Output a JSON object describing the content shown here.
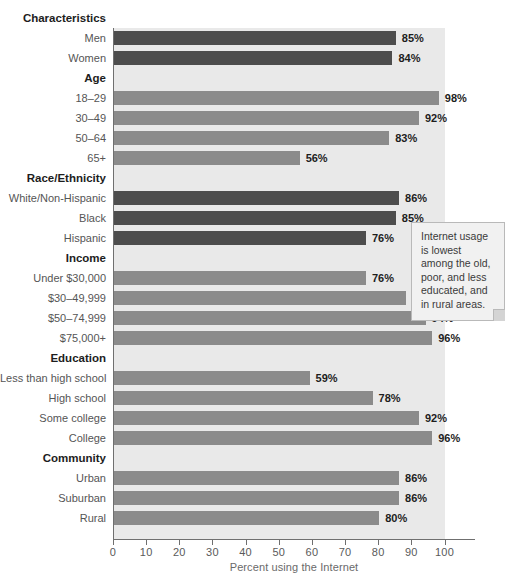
{
  "chart_data": {
    "type": "bar",
    "orientation": "horizontal",
    "title": "",
    "xlabel": "Percent using the Internet",
    "ylabel": "",
    "xlim": [
      0,
      100
    ],
    "xticks": [
      0,
      10,
      20,
      30,
      40,
      50,
      60,
      70,
      80,
      90,
      100
    ],
    "grid": false,
    "legend": null,
    "group_header": "Characteristics",
    "value_suffix": "%",
    "colors": {
      "bar_dark": "#4d4d4d",
      "bar_mid": "#8b8b8b",
      "plot_background": "#e9e9e9",
      "axis": "#6f6f6f",
      "label_text": "#555555",
      "value_text": "#1d1d1d",
      "callout_background": "#f1f1f1",
      "callout_border": "#b9b9b9"
    },
    "groups": [
      {
        "name": "Characteristics",
        "is_top_header": true,
        "shade": "dark",
        "items": [
          {
            "label": "Men",
            "value": 85,
            "value_label": "85%"
          },
          {
            "label": "Women",
            "value": 84,
            "value_label": "84%"
          }
        ]
      },
      {
        "name": "Age",
        "is_top_header": false,
        "shade": "mid",
        "items": [
          {
            "label": "18–29",
            "value": 98,
            "value_label": "98%"
          },
          {
            "label": "30–49",
            "value": 92,
            "value_label": "92%"
          },
          {
            "label": "50–64",
            "value": 83,
            "value_label": "83%"
          },
          {
            "label": "65+",
            "value": 56,
            "value_label": "56%"
          }
        ]
      },
      {
        "name": "Race/Ethnicity",
        "is_top_header": false,
        "shade": "dark",
        "items": [
          {
            "label": "White/Non-Hispanic",
            "value": 86,
            "value_label": "86%"
          },
          {
            "label": "Black",
            "value": 85,
            "value_label": "85%"
          },
          {
            "label": "Hispanic",
            "value": 76,
            "value_label": "76%"
          }
        ]
      },
      {
        "name": "Income",
        "is_top_header": false,
        "shade": "mid",
        "items": [
          {
            "label": "Under $30,000",
            "value": 76,
            "value_label": "76%"
          },
          {
            "label": "$30–49,999",
            "value": 88,
            "value_label": "88%"
          },
          {
            "label": "$50–74,999",
            "value": 94,
            "value_label": "94%"
          },
          {
            "label": "$75,000+",
            "value": 96,
            "value_label": "96%"
          }
        ]
      },
      {
        "name": "Education",
        "is_top_header": false,
        "shade": "mid",
        "items": [
          {
            "label": "Less than high school",
            "value": 59,
            "value_label": "59%"
          },
          {
            "label": "High school",
            "value": 78,
            "value_label": "78%"
          },
          {
            "label": "Some college",
            "value": 92,
            "value_label": "92%"
          },
          {
            "label": "College",
            "value": 96,
            "value_label": "96%"
          }
        ]
      },
      {
        "name": "Community",
        "is_top_header": false,
        "shade": "mid",
        "items": [
          {
            "label": "Urban",
            "value": 86,
            "value_label": "86%"
          },
          {
            "label": "Suburban",
            "value": 86,
            "value_label": "86%"
          },
          {
            "label": "Rural",
            "value": 80,
            "value_label": "80%"
          }
        ]
      }
    ],
    "annotations": [
      {
        "id": "callout",
        "text": "Internet usage is lowest among the old, poor, and less educated, and in rural areas."
      }
    ]
  }
}
